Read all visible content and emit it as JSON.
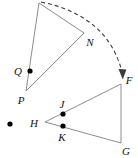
{
  "figure": {
    "canvas": {
      "width": 138,
      "height": 158,
      "background": "#ffffff"
    },
    "style": {
      "stroke_color": "#8c8c8c",
      "dashed_stroke_color": "#3a3a3a",
      "point_color": "#000000",
      "label_color": "#111111",
      "stroke_width": 1,
      "dash_pattern": "4 3",
      "point_radius": 2.6
    },
    "labels": {
      "Q": "Q",
      "P": "P",
      "N": "N",
      "F": "F",
      "H": "H",
      "J": "J",
      "K": "K",
      "G": "G"
    },
    "points": [
      {
        "name": "apex",
        "label": "",
        "x": 39,
        "y": 3,
        "dot": false
      },
      {
        "name": "Q",
        "label": "Q",
        "x": 30,
        "y": 71,
        "dot": true,
        "label_x": 18,
        "label_y": 75
      },
      {
        "name": "P",
        "label": "P",
        "x": 26,
        "y": 91,
        "dot": false,
        "label_x": 21,
        "label_y": 104
      },
      {
        "name": "N",
        "label": "N",
        "x": 84,
        "y": 33,
        "dot": false,
        "label_x": 86,
        "label_y": 45
      },
      {
        "name": "F",
        "label": "F",
        "x": 122,
        "y": 82,
        "dot": false,
        "label_x": 124,
        "label_y": 82
      },
      {
        "name": "H",
        "label": "H",
        "x": 45,
        "y": 122,
        "dot": false,
        "label_x": 29,
        "label_y": 127
      },
      {
        "name": "J",
        "label": "J",
        "x": 63,
        "y": 114,
        "dot": true,
        "label_x": 59,
        "label_y": 107
      },
      {
        "name": "K",
        "label": "K",
        "x": 63,
        "y": 126,
        "dot": true,
        "label_x": 58,
        "label_y": 141
      },
      {
        "name": "G",
        "label": "G",
        "x": 121,
        "y": 143,
        "dot": false,
        "label_x": 123,
        "label_y": 155
      },
      {
        "name": "stray-dot",
        "label": "",
        "x": 10,
        "y": 124,
        "dot": true
      }
    ],
    "segments": [
      {
        "name": "apex-to-P",
        "x1": 39,
        "y1": 3,
        "x2": 26,
        "y2": 91
      },
      {
        "name": "apex-to-N",
        "x1": 39,
        "y1": 3,
        "x2": 84,
        "y2": 33
      },
      {
        "name": "N-to-P",
        "x1": 84,
        "y1": 33,
        "x2": 26,
        "y2": 91
      },
      {
        "name": "H-to-F",
        "x1": 45,
        "y1": 122,
        "x2": 121,
        "y2": 84
      },
      {
        "name": "F-to-G",
        "x1": 121,
        "y1": 84,
        "x2": 121,
        "y2": 143
      },
      {
        "name": "H-to-G",
        "x1": 45,
        "y1": 122,
        "x2": 121,
        "y2": 143
      }
    ],
    "arc": {
      "name": "rotation-arc",
      "path": "M 41 2 Q 110 16 123 76",
      "arrowhead": "M 118.5 69 L 122.8 79.5 L 126.4 69.6 Z",
      "dashed": true
    }
  }
}
